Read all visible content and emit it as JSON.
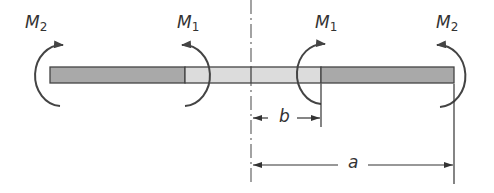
{
  "diagram": {
    "type": "beam with applied moments",
    "colors": {
      "outer_segment": "#a9a9a9",
      "inner_segment": "#dcdcdc",
      "outline": "#444444",
      "arrow": "#444444",
      "centerline": "#666666"
    },
    "moments": [
      {
        "id": "m2-left",
        "symbol": "M",
        "subscript": "2",
        "side": "left"
      },
      {
        "id": "m1-left",
        "symbol": "M",
        "subscript": "1",
        "side": "left"
      },
      {
        "id": "m1-right",
        "symbol": "M",
        "subscript": "1",
        "side": "right"
      },
      {
        "id": "m2-right",
        "symbol": "M",
        "subscript": "2",
        "side": "right"
      }
    ],
    "dimensions": [
      {
        "id": "dim-b",
        "label": "b",
        "from": "centerline",
        "to": "inner moment location"
      },
      {
        "id": "dim-a",
        "label": "a",
        "from": "centerline",
        "to": "beam end"
      }
    ]
  }
}
